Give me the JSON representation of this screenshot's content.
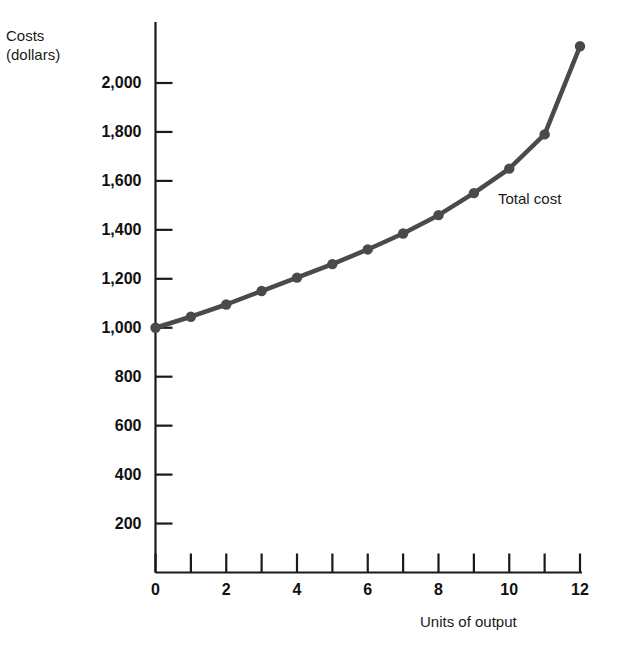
{
  "chart_data": {
    "type": "line",
    "title": "",
    "xlabel": "Units of output",
    "ylabel": "Costs\n(dollars)",
    "ylabel_line1": "Costs",
    "ylabel_line2": "(dollars)",
    "series_label": "Total cost",
    "grid": false,
    "legend_position": "inline-right",
    "xlim": [
      0,
      12
    ],
    "ylim": [
      0,
      2200
    ],
    "x": [
      0,
      1,
      2,
      3,
      4,
      5,
      6,
      7,
      8,
      9,
      10,
      11,
      12
    ],
    "values": [
      1000,
      1045,
      1095,
      1150,
      1205,
      1260,
      1320,
      1385,
      1460,
      1550,
      1650,
      1790,
      2150
    ],
    "series": [
      {
        "name": "Total cost",
        "values": [
          1000,
          1045,
          1095,
          1150,
          1205,
          1260,
          1320,
          1385,
          1460,
          1550,
          1650,
          1790,
          2150
        ]
      }
    ],
    "x_tick_values": [
      0,
      1,
      2,
      3,
      4,
      5,
      6,
      7,
      8,
      9,
      10,
      11,
      12
    ],
    "x_tick_labels": [
      "0",
      "",
      "2",
      "",
      "4",
      "",
      "6",
      "",
      "8",
      "",
      "10",
      "",
      "12"
    ],
    "y_tick_values": [
      200,
      400,
      600,
      800,
      1000,
      1200,
      1400,
      1600,
      1800,
      2000
    ],
    "y_tick_labels": [
      "200",
      "400",
      "600",
      "800",
      "1,000",
      "1,200",
      "1,400",
      "1,600",
      "1,800",
      "2,000"
    ],
    "line_color": "#4a4a4a",
    "marker_color": "#4a4a4a",
    "axis_color": "#1a1a1a",
    "background_color": "#ffffff"
  }
}
